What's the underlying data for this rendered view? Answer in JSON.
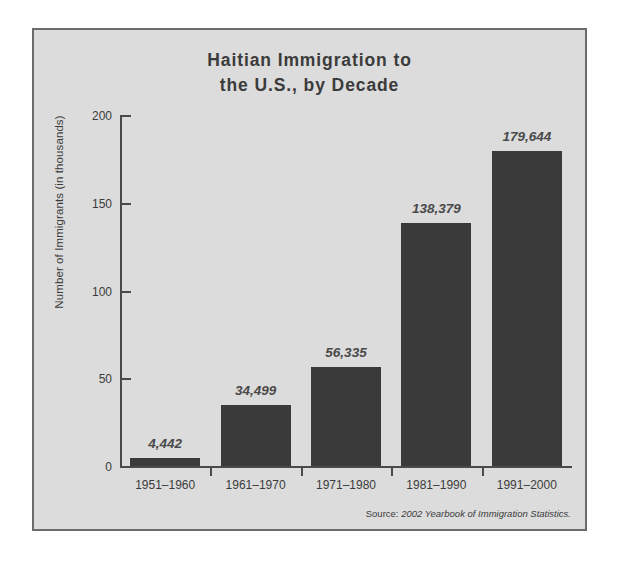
{
  "chart_data": {
    "type": "bar",
    "title": "Haitian Immigration to\nthe U.S., by Decade",
    "xlabel": "",
    "ylabel": "Number of Immigrants (in thousands)",
    "categories": [
      "1951–1960",
      "1961–1970",
      "1971–1980",
      "1981–1990",
      "1991–2000"
    ],
    "values": [
      4.442,
      34.499,
      56.335,
      138.379,
      179.644
    ],
    "data_labels": [
      "4,442",
      "34,499",
      "56,335",
      "138,379",
      "179,644"
    ],
    "ylim": [
      0,
      200
    ],
    "yticks": [
      0,
      50,
      100,
      150,
      200
    ],
    "ytick_labels": [
      "0",
      "50",
      "100",
      "150",
      "200"
    ],
    "grid": false,
    "legend": false,
    "bar_color": "#3a3a3a",
    "panel_color": "#dcdcdc",
    "axis_color": "#4a4a4a",
    "text_color": "#3b3b3b"
  },
  "source": {
    "label": "Source:",
    "text": "2002 Yearbook of Immigration Statistics."
  }
}
